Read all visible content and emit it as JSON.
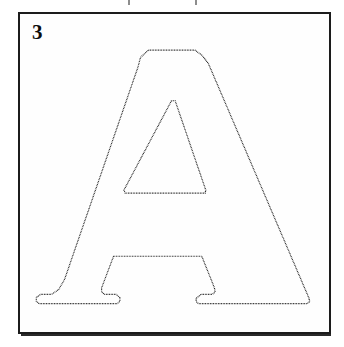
{
  "page": {
    "background_color": "#ffffff",
    "width": 344,
    "height": 347
  },
  "top_artifacts": {
    "name": "cropped-text-marks",
    "description": "faint cut-off descenders from the line of text above the panel",
    "color": "#8d8d8d",
    "marks": [
      {
        "x": 128
      },
      {
        "x": 195
      }
    ]
  },
  "panel": {
    "number_label": "3",
    "border_color": "#1c1c1c",
    "fill_color": "#fefefe",
    "x": 18,
    "y": 12,
    "width": 313,
    "height": 322
  },
  "figure": {
    "name": "letter-a-tracing-outline",
    "letter": "A",
    "style": "dotted outline tracing guide",
    "dot_color": "#111111",
    "dot_size_px": 3,
    "dot_pitch_px": 5,
    "outer_outline_path": "M 386 108 L 525 108 L 547 124 L 566 149 L 868 852 L 870 862 L 862 868 L 536 868 L 529 862 L 529 852 L 544 840 L 578 840 L 586 833 L 584 821 L 546 726 L 281 726 L 245 821 L 245 833 L 253 840 L 288 840 L 300 850 L 300 861 L 292 868 L 57 868 L 49 861 L 49 849 L 63 840 L 95 840 L 116 826 L 134 795 L 354 160 L 362 130 Z",
    "inner_counter_path": "M 455 260 L 466 260 L 558 528 L 556 537 L 316 537 L 312 528 Z",
    "viewbox": "0 0 940 965"
  }
}
